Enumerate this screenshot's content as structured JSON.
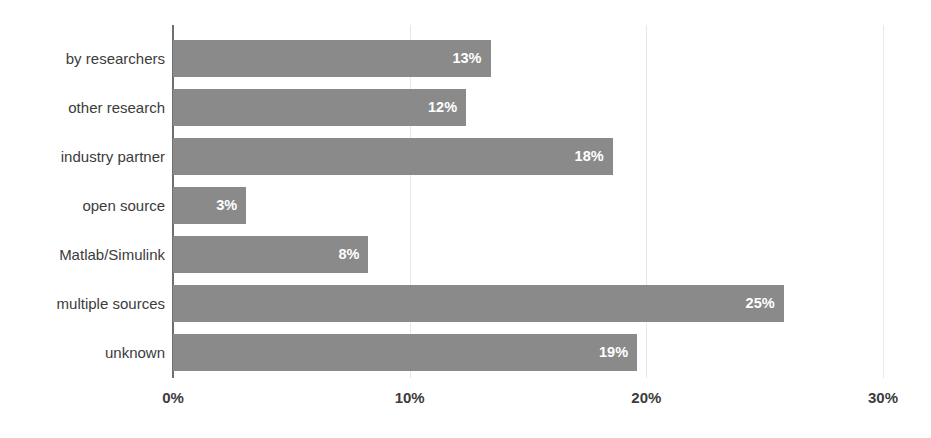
{
  "chart_data": {
    "type": "bar",
    "orientation": "horizontal",
    "title": "",
    "subtitle": "",
    "xlabel": "",
    "ylabel": "",
    "categories": [
      "by researchers",
      "other research",
      "industry partner",
      "open source",
      "Matlab/Simulink",
      "multiple sources",
      "unknown"
    ],
    "values": [
      13,
      12,
      18,
      3,
      8,
      25,
      19
    ],
    "data_labels": [
      "13%",
      "12%",
      "18%",
      "3%",
      "8%",
      "25%",
      "19%"
    ],
    "xlim": [
      0,
      30
    ],
    "xticks": [
      0,
      10,
      20,
      30
    ],
    "xtick_labels": [
      "0%",
      "10%",
      "20%",
      "30%"
    ],
    "grid": true,
    "grid_axis": "x",
    "legend": false,
    "legend_position": "none",
    "bar_color": "#8a8a8a",
    "label_text_color": "#ffffff",
    "axis_text_color": "#3c3c3c",
    "gridline_color": "#e8e8e8",
    "axis_line_color": "#6f6f6f",
    "background_color": "#ffffff"
  }
}
